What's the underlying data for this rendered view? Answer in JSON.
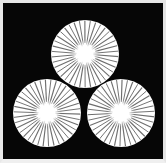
{
  "image": {
    "title": "Three-disc radiating crest",
    "description": "Japanese-style family crest: three white radiating sun discs arranged in a triangle on a black square plate",
    "width": 166,
    "height": 163
  },
  "colors": {
    "background": "#f2f2f2",
    "plate": "#060606",
    "disc_fill": "#ffffff",
    "spoke": "#6e6e6e",
    "core_glow": "#ffffff",
    "frame": "#e8e8e8"
  },
  "plate": {
    "x": 3,
    "y": 3,
    "width": 160,
    "height": 156,
    "shape": "rectangle"
  },
  "discs": [
    {
      "name": "top-disc",
      "position_label": "top",
      "cx": 85,
      "cy": 54,
      "r": 34,
      "spoke_count": 38,
      "core_radius": 9,
      "rotation_deg": 4.5
    },
    {
      "name": "bottom-left-disc",
      "position_label": "bottom-left",
      "cx": 47,
      "cy": 113,
      "r": 34,
      "spoke_count": 38,
      "core_radius": 9,
      "rotation_deg": 2.0
    },
    {
      "name": "bottom-right-disc",
      "position_label": "bottom-right",
      "cx": 121,
      "cy": 113,
      "r": 34,
      "spoke_count": 38,
      "core_radius": 9,
      "rotation_deg": 6.5
    }
  ]
}
